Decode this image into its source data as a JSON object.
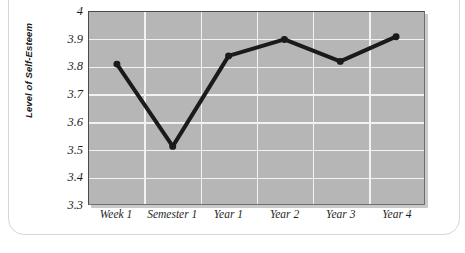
{
  "figure": {
    "top_caption_fragment": "",
    "background_color": "#ffffff",
    "frame_color": "#d6d6d6"
  },
  "chart_data": {
    "type": "line",
    "title": "",
    "subtitle": "",
    "xlabel": "",
    "ylabel": "Level of Self-Esteem",
    "categories": [
      "Week 1",
      "Semester 1",
      "Year 1",
      "Year 2",
      "Year 3",
      "Year 4"
    ],
    "values": [
      3.81,
      3.51,
      3.84,
      3.9,
      3.82,
      3.91
    ],
    "series": [
      {
        "name": "Level of Self-Esteem",
        "values": [
          3.81,
          3.51,
          3.84,
          3.9,
          3.82,
          3.91
        ]
      }
    ],
    "ylim": [
      3.3,
      4.0
    ],
    "ytick_labels": [
      "4",
      "3.9",
      "3.8",
      "3.7",
      "3.6",
      "3.5",
      "3.4",
      "3.3"
    ],
    "ytick_values": [
      4.0,
      3.9,
      3.8,
      3.7,
      3.6,
      3.5,
      3.4,
      3.3
    ],
    "grid": true,
    "grid_color": "#f2f2f2",
    "grid_orientation": "both",
    "legend": false,
    "legend_position": "none",
    "plot_background_color": "#b6b6b6",
    "line_color": "#1a1a1a",
    "line_width": 4,
    "marker": "circle",
    "marker_color": "#1a1a1a",
    "marker_size": 7,
    "annotations": []
  }
}
